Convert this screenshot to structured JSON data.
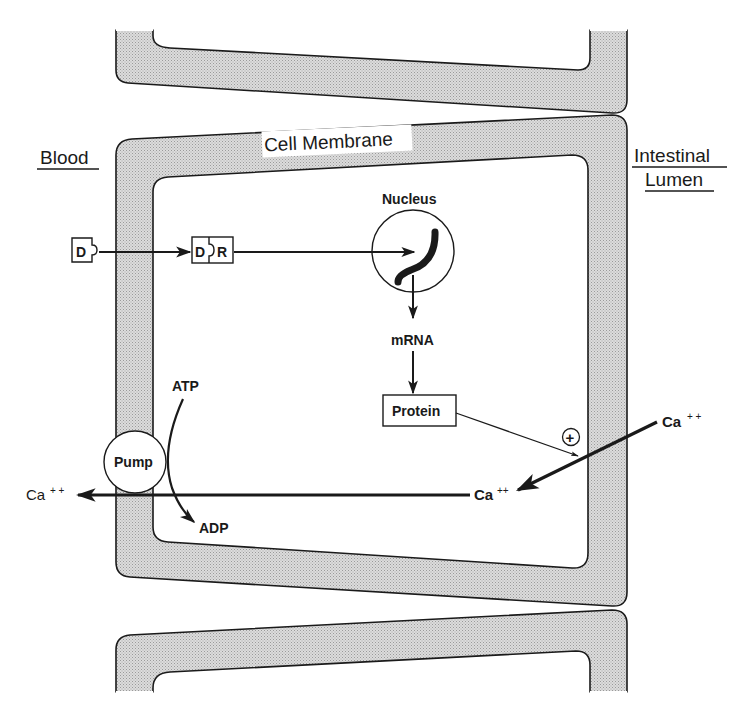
{
  "diagram": {
    "type": "cell-transport-pathway",
    "colors": {
      "membrane_fill": "#d4d4d4",
      "stroke": "#1a1a1a",
      "background": "#ffffff"
    },
    "regions": {
      "blood": "Blood",
      "lumen_line1": "Intestinal",
      "lumen_line2": "Lumen",
      "membrane": "Cell Membrane"
    },
    "nodes": {
      "d_ligand": "D",
      "dr_complex_d": "D",
      "dr_complex_r": "R",
      "nucleus": "Nucleus",
      "mrna": "mRNA",
      "protein": "Protein",
      "pump": "Pump",
      "atp": "ATP",
      "adp": "ADP",
      "plus_sign": "+",
      "ca_lumen": "Ca",
      "ca_lumen_charge": "+ +",
      "ca_cytosol": "Ca",
      "ca_cytosol_charge": "++",
      "ca_blood": "Ca",
      "ca_blood_charge": "+ +"
    },
    "edges": [
      {
        "from": "D",
        "to": "D-R complex"
      },
      {
        "from": "D-R complex",
        "to": "Nucleus"
      },
      {
        "from": "Nucleus",
        "to": "mRNA"
      },
      {
        "from": "mRNA",
        "to": "Protein"
      },
      {
        "from": "Protein",
        "to": "Ca++ entry (stimulates +)"
      },
      {
        "from": "Ca++ (lumen)",
        "to": "Ca++ (cytosol)"
      },
      {
        "from": "Ca++ (cytosol)",
        "to": "Ca++ (blood) via Pump"
      },
      {
        "from": "ATP",
        "to": "ADP"
      }
    ]
  }
}
